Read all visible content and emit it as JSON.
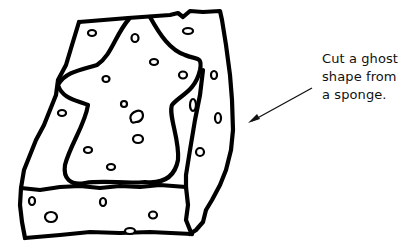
{
  "illustration": {
    "subject": "sponge block with ghost shape outline",
    "icon": "sponge-ghost-drawing",
    "colors": {
      "ink": "#000000",
      "background": "#ffffff"
    }
  },
  "caption": {
    "lines": [
      "Cut a ghost",
      "shape from",
      "a sponge."
    ]
  },
  "pointer": {
    "icon": "arrow-pointer",
    "direction": "down-left"
  }
}
